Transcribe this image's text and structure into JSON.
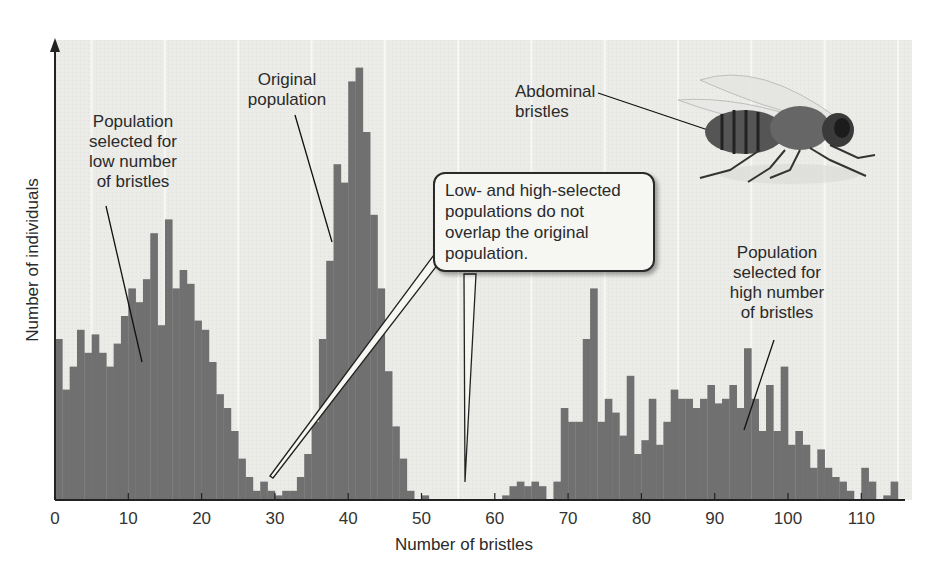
{
  "chart_data": {
    "type": "bar",
    "title": "",
    "xlabel": "Number of bristles",
    "ylabel": "Number of individuals",
    "xlim": [
      0,
      116
    ],
    "ylim": [
      0,
      100
    ],
    "x_ticks": [
      0,
      10,
      20,
      30,
      40,
      50,
      60,
      70,
      80,
      90,
      100,
      110
    ],
    "y_ticks": [],
    "grid": false,
    "legend": null,
    "bar_color": "#707070",
    "background_color": "#ececea",
    "series": [
      {
        "name": "Population selected for low number of bristles",
        "x": [
          0,
          1,
          2,
          3,
          4,
          5,
          6,
          7,
          8,
          9,
          10,
          11,
          12,
          13,
          14,
          15,
          16,
          17,
          18,
          19,
          20,
          21,
          22,
          23,
          24,
          25,
          26,
          27,
          28,
          29,
          30,
          31
        ],
        "values": [
          35,
          24,
          29,
          37,
          32,
          36,
          32,
          29,
          34,
          40,
          46,
          43,
          48,
          58,
          38,
          61,
          46,
          50,
          47,
          39,
          37,
          30,
          23,
          20,
          15,
          9,
          5,
          2,
          4,
          2,
          1,
          2
        ]
      },
      {
        "name": "Original population",
        "x": [
          32,
          33,
          34,
          35,
          36,
          37,
          38,
          39,
          40,
          41,
          42,
          43,
          44,
          45,
          46,
          47,
          48,
          49,
          50
        ],
        "values": [
          2,
          5,
          10,
          17,
          35,
          52,
          73,
          69,
          91,
          94,
          80,
          62,
          46,
          28,
          16,
          9,
          2,
          0,
          1
        ]
      },
      {
        "name": "Population selected for high number of bristles",
        "x": [
          61,
          62,
          63,
          64,
          65,
          66,
          68,
          69,
          70,
          71,
          72,
          73,
          74,
          75,
          76,
          77,
          78,
          79,
          80,
          81,
          82,
          83,
          84,
          85,
          86,
          87,
          88,
          89,
          90,
          91,
          92,
          93,
          94,
          95,
          96,
          97,
          98,
          99,
          100,
          101,
          102,
          103,
          104,
          105,
          106,
          107,
          108,
          110,
          111,
          113,
          114
        ],
        "values": [
          1,
          3,
          4,
          3,
          4,
          3,
          4,
          20,
          17,
          17,
          35,
          46,
          17,
          22,
          19,
          14,
          27,
          10,
          13,
          22,
          12,
          17,
          24,
          22,
          22,
          20,
          22,
          25,
          21,
          22,
          25,
          20,
          33,
          22,
          15,
          25,
          15,
          29,
          12,
          15,
          12,
          7,
          11,
          7,
          5,
          4,
          2,
          7,
          4,
          1,
          4
        ]
      }
    ],
    "annotations": [
      {
        "text": "Original\npopulation",
        "points_to_x": 38
      },
      {
        "text": "Population\nselected for\nlow number\nof bristles",
        "points_to_x": 12
      },
      {
        "text": "Population\nselected for\nhigh number\nof bristles",
        "points_to_x": 94
      },
      {
        "text": "Abdominal\nbristles",
        "points_to": "fly abdomen illustration"
      },
      {
        "text": "Low- and high-selected\npopulations do not\noverlap the original\npopulation.",
        "type": "callout",
        "points_to_x": [
          30,
          56
        ]
      }
    ]
  },
  "labels": {
    "original": "Original\npopulation",
    "low": "Population\nselected for\nlow number\nof bristles",
    "high": "Population\nselected for\nhigh number\nof bristles",
    "abdominal": "Abdominal\nbristles",
    "callout": "Low- and high-selected\npopulations do not\noverlap the original\npopulation.",
    "xlabel": "Number of bristles",
    "ylabel": "Number of individuals"
  }
}
